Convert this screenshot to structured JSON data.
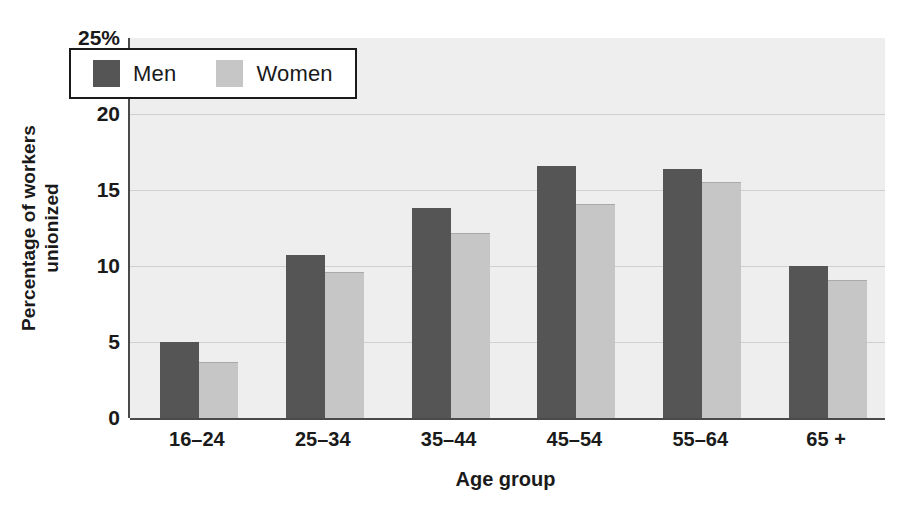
{
  "chart_data": {
    "type": "bar",
    "title": "",
    "xlabel": "Age group",
    "ylabel": "Percentage of workers unionized",
    "ylabel_line1": "Percentage of workers",
    "ylabel_line2": "unionized",
    "categories": [
      "16–24",
      "25–34",
      "35–44",
      "45–54",
      "55–64",
      "65 +"
    ],
    "series": [
      {
        "name": "Men",
        "color": "#555555",
        "values": [
          5.0,
          10.7,
          13.8,
          16.6,
          16.4,
          10.0
        ]
      },
      {
        "name": "Women",
        "color": "#c6c6c6",
        "values": [
          3.7,
          9.6,
          12.2,
          14.1,
          15.5,
          9.1
        ]
      }
    ],
    "ylim": [
      0,
      25
    ],
    "ytick_values": [
      25,
      20,
      15,
      10,
      5,
      0
    ],
    "ytick_labels": [
      "25%",
      "20",
      "15",
      "10",
      "5",
      "0"
    ],
    "grid": true,
    "grid_color": "#cfcfcf",
    "legend_position": "top-left-inside",
    "plot_background": "#eeeeee",
    "axis_color": "#4a4a4a"
  },
  "legend": {
    "items": [
      {
        "label": "Men",
        "color": "#555555"
      },
      {
        "label": "Women",
        "color": "#c6c6c6"
      }
    ]
  }
}
